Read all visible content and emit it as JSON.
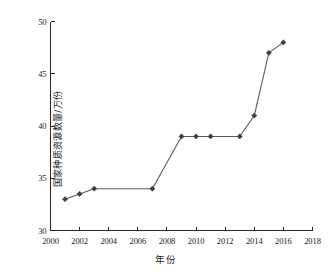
{
  "chart_data": {
    "type": "line",
    "title": "",
    "subtitle": "",
    "xlabel": "年份",
    "ylabel": "国家种质资源数量/万份",
    "xlim": [
      2000,
      2018
    ],
    "ylim": [
      30,
      50
    ],
    "xticks": [
      2000,
      2002,
      2004,
      2006,
      2008,
      2010,
      2012,
      2014,
      2016,
      2018
    ],
    "yticks": [
      30,
      35,
      40,
      45,
      50
    ],
    "grid": false,
    "legend": false,
    "legend_position": "none",
    "marker": "diamond",
    "series": [
      {
        "name": "国家种质资源数量",
        "color": "#5a5a5a",
        "marker_color": "#3d3d3d",
        "x": [
          2001,
          2002,
          2003,
          2007,
          2009,
          2010,
          2011,
          2013,
          2014,
          2015,
          2016
        ],
        "values": [
          33,
          33.5,
          34,
          34,
          39,
          39,
          39,
          39,
          41,
          47,
          48
        ]
      }
    ],
    "annotations": []
  },
  "axis": {
    "x_tick_labels": [
      "2000",
      "2002",
      "2004",
      "2006",
      "2008",
      "2010",
      "2012",
      "2014",
      "2016",
      "2018"
    ],
    "y_tick_labels": [
      "30",
      "35",
      "40",
      "45",
      "50"
    ],
    "x_title": "年份",
    "y_title": "国家种质资源数量/万份"
  },
  "colors": {
    "background": "#ffffff",
    "axis": "#262626",
    "line": "#5a5a5a",
    "marker": "#3d3d3d",
    "text": "#1a1a1a"
  }
}
